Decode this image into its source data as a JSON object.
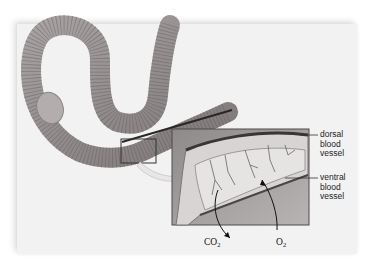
{
  "figure": {
    "inset": "magnified section of body wall showing capillary network"
  },
  "labels": {
    "dorsal": [
      "dorsal",
      "blood",
      "vessel"
    ],
    "ventral": [
      "ventral",
      "blood",
      "vessel"
    ]
  },
  "gases": {
    "co2_base": "CO",
    "co2_sub": "2",
    "o2_base": "O",
    "o2_sub": "2"
  },
  "colors": {
    "panel": "#f3f2f2",
    "worm_body": "#9a9494",
    "worm_dark": "#6e6868",
    "inset_border": "#4a4a4a",
    "text": "#222222"
  }
}
